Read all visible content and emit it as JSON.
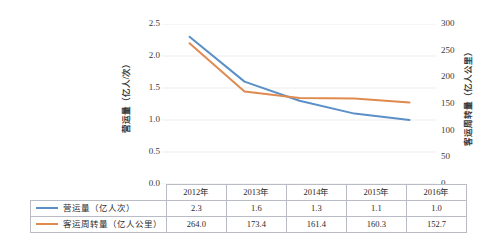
{
  "chart_data": {
    "type": "line",
    "title": "",
    "xlabel": "",
    "categories": [
      "2012年",
      "2013年",
      "2014年",
      "2015年",
      "2016年"
    ],
    "grid": true,
    "legend_position": "table-below",
    "series": [
      {
        "name": "营运量（亿人次）",
        "axis": "left",
        "color": "#5b8fc7",
        "values": [
          2.3,
          1.6,
          1.3,
          1.1,
          1.0
        ],
        "display_values": [
          "2.3",
          "1.6",
          "1.3",
          "1.1",
          "1.0"
        ]
      },
      {
        "name": "客运周转量（亿人公里）",
        "axis": "right",
        "color": "#e08a50",
        "values": [
          264.0,
          173.4,
          161.4,
          160.3,
          152.7
        ],
        "display_values": [
          "264.0",
          "173.4",
          "161.4",
          "160.3",
          "152.7"
        ]
      }
    ],
    "y_left": {
      "label": "营运量（亿人/次）",
      "min": 0.0,
      "max": 2.5,
      "step": 0.5,
      "ticks": [
        "0.0",
        "0.5",
        "1.0",
        "1.5",
        "2.0",
        "2.5"
      ]
    },
    "y_right": {
      "label": "客运周转量（亿人公里）",
      "min": 0,
      "max": 300,
      "step": 50,
      "ticks": [
        "0",
        "50",
        "100",
        "150",
        "200",
        "250",
        "300"
      ]
    }
  },
  "table": {
    "header_corner": "",
    "headers": [
      "2012年",
      "2013年",
      "2014年",
      "2015年",
      "2016年"
    ],
    "rows": [
      {
        "label": "营运量（亿人次）",
        "swatch": "line-swatch-blue",
        "cells": [
          "2.3",
          "1.6",
          "1.3",
          "1.1",
          "1.0"
        ]
      },
      {
        "label": "客运周转量（亿人公里）",
        "swatch": "line-swatch-orange",
        "cells": [
          "264.0",
          "173.4",
          "161.4",
          "160.3",
          "152.7"
        ]
      }
    ]
  },
  "colors": {
    "series_1": "#5b8fc7",
    "series_2": "#e08a50",
    "grid": "#ededed",
    "table_border": "#b9bcc4",
    "text": "#2b2b2b"
  }
}
